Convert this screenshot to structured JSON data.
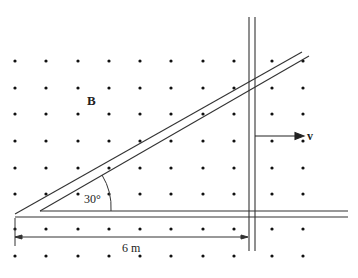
{
  "diagram": {
    "field_label": "B",
    "velocity_label": "v",
    "angle_label": "30°",
    "distance_label": "6 m",
    "line_color": "#333333",
    "dot_color": "#111111",
    "dot_grid": {
      "columns_x": [
        15,
        46,
        78,
        109,
        140,
        171,
        203,
        234,
        272,
        303
      ],
      "rows_y": [
        61,
        88,
        114,
        141,
        168,
        194,
        229,
        256
      ]
    }
  }
}
